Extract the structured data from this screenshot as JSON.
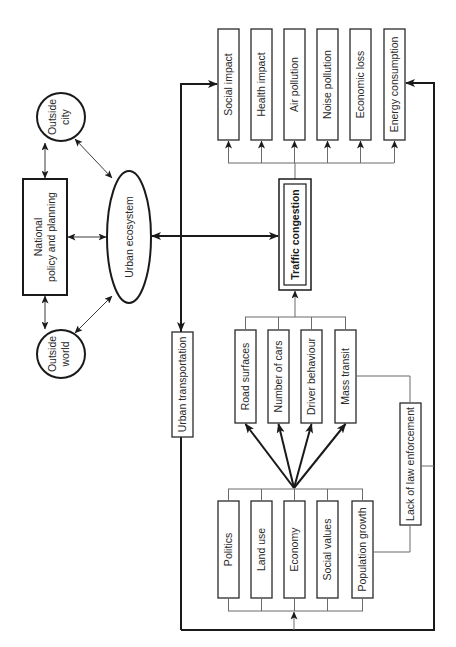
{
  "diagram": {
    "external": {
      "outside_city": [
        "Outside",
        "city"
      ],
      "outside_world": [
        "Outside",
        "world"
      ],
      "national_policy": [
        "National",
        "policy and planning"
      ],
      "urban_ecosystem": "Urban ecosystem"
    },
    "urban_transportation": "Urban transportation",
    "traffic_congestion": "Traffic congestion",
    "effects": [
      "Social impact",
      "Health impact",
      "Air pollution",
      "Noise pollution",
      "Economic loss",
      "Energy consumption"
    ],
    "direct_causes": [
      "Road surfaces",
      "Number of cars",
      "Driver behaviour",
      "Mass transit"
    ],
    "root_causes": [
      "Politics",
      "Land use",
      "Economy",
      "Social values",
      "Population growth"
    ],
    "lack_of_law_enforcement": "Lack of law enforcement"
  }
}
